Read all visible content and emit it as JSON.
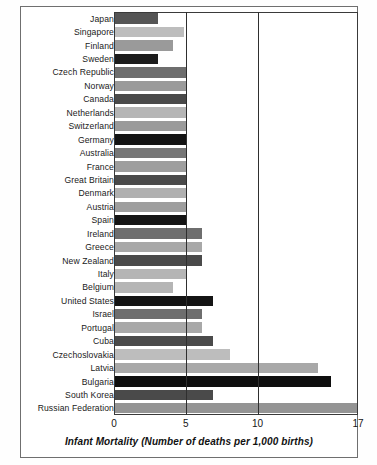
{
  "chart_data": {
    "type": "bar",
    "orientation": "horizontal",
    "title": "",
    "xlabel": "Infant Mortality (Number of deaths per 1,000 births)",
    "ylabel": "",
    "xlim": [
      0,
      17
    ],
    "xticks": [
      0,
      5,
      10,
      17
    ],
    "xtick_labels": [
      "0",
      "5",
      "10",
      "17"
    ],
    "gridlines": [
      5,
      10
    ],
    "grid": true,
    "legend": "none",
    "categories": [
      "Japan",
      "Singapore",
      "Finland",
      "Sweden",
      "Czech Republic",
      "Norway",
      "Canada",
      "Netherlands",
      "Switzerland",
      "Germany",
      "Australia",
      "France",
      "Great Britain",
      "Denmark",
      "Austria",
      "Spain",
      "Ireland",
      "Greece",
      "New Zealand",
      "Italy",
      "Belgium",
      "United States",
      "Israel",
      "Portugal",
      "Cuba",
      "Czechoslovakia",
      "Latvia",
      "Bulgaria",
      "South Korea",
      "Russian Federation"
    ],
    "values": [
      3.1,
      4.9,
      4.1,
      3.1,
      5.0,
      5.0,
      5.0,
      5.0,
      5.0,
      5.0,
      5.0,
      5.0,
      5.0,
      5.0,
      5.0,
      5.0,
      6.1,
      6.1,
      6.1,
      5.0,
      4.1,
      6.9,
      6.1,
      6.1,
      6.9,
      8.1,
      14.2,
      15.1,
      6.9,
      17.0
    ],
    "bar_colors": [
      "#555555",
      "#bdbdbd",
      "#9a9a9a",
      "#1c1c1c",
      "#6e6e6e",
      "#9a9a9a",
      "#4a4a4a",
      "#b5b5b5",
      "#9a9a9a",
      "#141414",
      "#777777",
      "#9e9e9e",
      "#4a4a4a",
      "#b0b0b0",
      "#9e9e9e",
      "#141414",
      "#6e6e6e",
      "#a8a8a8",
      "#4a4a4a",
      "#b5b5b5",
      "#b5b5b5",
      "#141414",
      "#6e6e6e",
      "#a8a8a8",
      "#4a4a4a",
      "#bdbdbd",
      "#a8a8a8",
      "#0e0e0e",
      "#4a4a4a",
      "#949494"
    ]
  }
}
